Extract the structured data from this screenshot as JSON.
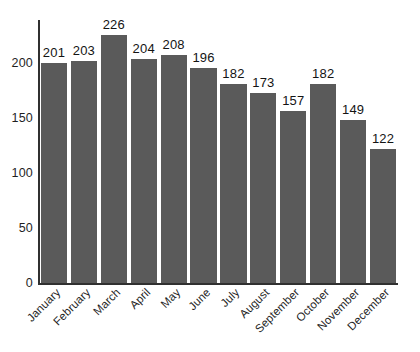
{
  "chart_data": {
    "type": "bar",
    "title": "",
    "subtitle": "",
    "xlabel": "",
    "ylabel": "",
    "categories": [
      "January",
      "February",
      "March",
      "April",
      "May",
      "June",
      "July",
      "August",
      "September",
      "October",
      "November",
      "December"
    ],
    "values": [
      201,
      203,
      226,
      204,
      208,
      196,
      182,
      173,
      157,
      182,
      149,
      122
    ],
    "value_labels": [
      "201",
      "203",
      "226",
      "204",
      "208",
      "196",
      "182",
      "173",
      "157",
      "182",
      "149",
      "122"
    ],
    "series": [
      {
        "name": "",
        "values": [
          201,
          203,
          226,
          204,
          208,
          196,
          182,
          173,
          157,
          182,
          149,
          122
        ]
      }
    ],
    "ylim": [
      0,
      240
    ],
    "yticks": [
      0,
      50,
      100,
      150,
      200
    ],
    "ytick_labels": [
      "0",
      "50",
      "100",
      "150",
      "200"
    ],
    "grid": false,
    "legend": false,
    "legend_position": "none",
    "bar_color": "#5a5a5a",
    "axis_color": "#303030",
    "background_color": "#ffffff",
    "text_color": "#1f1f1f",
    "x_tick_rotation": -45
  }
}
